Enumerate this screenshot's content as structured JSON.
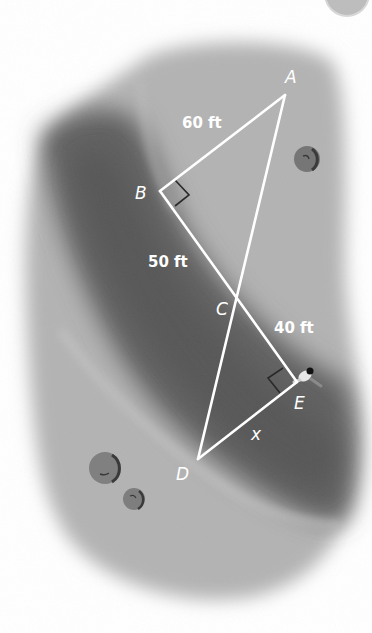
{
  "diagram": {
    "type": "similar right triangles over terrain (pond/ravine)",
    "points": {
      "A": {
        "label": "A",
        "x": 285,
        "y": 95
      },
      "B": {
        "label": "B",
        "x": 160,
        "y": 191
      },
      "C": {
        "label": "C",
        "x": 235,
        "y": 297
      },
      "D": {
        "label": "D",
        "x": 198,
        "y": 459
      },
      "E": {
        "label": "E",
        "x": 297,
        "y": 382
      }
    },
    "segments": [
      {
        "from": "A",
        "to": "B"
      },
      {
        "from": "B",
        "to": "E"
      },
      {
        "from": "A",
        "to": "D"
      },
      {
        "from": "D",
        "to": "E"
      }
    ],
    "right_angles": [
      "B",
      "E"
    ],
    "measurements": {
      "AB": "60 ft",
      "BC": "50 ft",
      "CE": "40 ft",
      "DE": "x"
    },
    "colors": {
      "line": "#ffffff",
      "right_angle_mark": "#2a2a2a",
      "terrain_light": "#a9a9a9",
      "terrain_dark": "#5c5c5c",
      "bush": "#7a7a7a"
    }
  }
}
